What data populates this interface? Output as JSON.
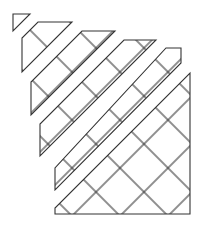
{
  "figure": {
    "stroke_color": "#333333",
    "background": "#ffffff",
    "strips": 5,
    "main_region": "trapezoid with square lattice"
  }
}
